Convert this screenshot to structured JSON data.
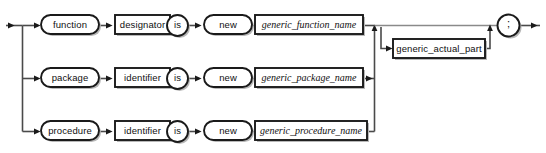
{
  "diagram": {
    "kind": "railroad-syntax-diagram",
    "background_color": "#ffffff",
    "line_color": "#4a4a4a",
    "shape_stroke_color": "#1a1a1a",
    "shadow_color": "#b8b8b8",
    "entry": {
      "name": "entry-arrow"
    },
    "exit": {
      "name": "exit-arrow"
    },
    "rows": [
      {
        "id": "row-function",
        "nodes": [
          {
            "id": "function-keyword",
            "label": "function",
            "shape": "stadium"
          },
          {
            "id": "designator-box",
            "label": "designator",
            "shape": "rect"
          },
          {
            "id": "is-keyword-1",
            "label": "is",
            "shape": "circle"
          },
          {
            "id": "new-keyword-1",
            "label": "new",
            "shape": "stadium"
          },
          {
            "id": "generic-function-name",
            "label": "generic_function_name",
            "shape": "rect",
            "italic": true
          }
        ]
      },
      {
        "id": "row-package",
        "nodes": [
          {
            "id": "package-keyword",
            "label": "package",
            "shape": "stadium"
          },
          {
            "id": "identifier-box-1",
            "label": "identifier",
            "shape": "rect"
          },
          {
            "id": "is-keyword-2",
            "label": "is",
            "shape": "circle"
          },
          {
            "id": "new-keyword-2",
            "label": "new",
            "shape": "stadium"
          },
          {
            "id": "generic-package-name",
            "label": "generic_package_name",
            "shape": "rect",
            "italic": true
          }
        ]
      },
      {
        "id": "row-procedure",
        "nodes": [
          {
            "id": "procedure-keyword",
            "label": "procedure",
            "shape": "stadium"
          },
          {
            "id": "identifier-box-2",
            "label": "identifier",
            "shape": "rect"
          },
          {
            "id": "is-keyword-3",
            "label": "is",
            "shape": "circle"
          },
          {
            "id": "new-keyword-3",
            "label": "new",
            "shape": "stadium"
          },
          {
            "id": "generic-procedure-name",
            "label": "generic_procedure_name",
            "shape": "rect",
            "italic": true
          }
        ]
      }
    ],
    "optional_branch": {
      "id": "generic-actual-part",
      "label": "generic_actual_part",
      "shape": "rect"
    },
    "terminator": {
      "id": "semicolon-terminator",
      "label": ";",
      "shape": "circle"
    }
  }
}
